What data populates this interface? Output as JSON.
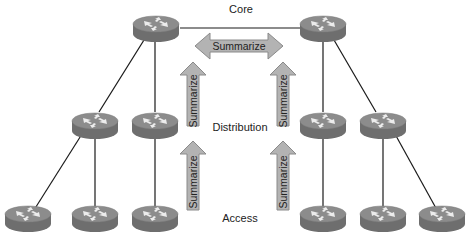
{
  "layers": {
    "core": "Core",
    "distribution": "Distribution",
    "access": "Access"
  },
  "arrows": {
    "core_horizontal": "Summarize",
    "left_upper": "Summarize",
    "right_upper": "Summarize",
    "left_lower": "Summarize",
    "right_lower": "Summarize"
  },
  "colors": {
    "router_top": "#8c8c8c",
    "router_side": "#6e6e6e",
    "arrow_fill": "#b3b3b3",
    "arrow_stroke": "#8a8a8a",
    "link": "#1a1a1a"
  },
  "routers": [
    {
      "id": "core-left",
      "layer": "core",
      "cx": 156,
      "cy": 28
    },
    {
      "id": "core-right",
      "layer": "core",
      "cx": 323,
      "cy": 28
    },
    {
      "id": "dist-left-1",
      "layer": "distribution",
      "cx": 95,
      "cy": 125
    },
    {
      "id": "dist-left-2",
      "layer": "distribution",
      "cx": 155,
      "cy": 125
    },
    {
      "id": "dist-right-1",
      "layer": "distribution",
      "cx": 323,
      "cy": 125
    },
    {
      "id": "dist-right-2",
      "layer": "distribution",
      "cx": 383,
      "cy": 125
    },
    {
      "id": "access-left-1",
      "layer": "access",
      "cx": 28,
      "cy": 218
    },
    {
      "id": "access-left-2",
      "layer": "access",
      "cx": 95,
      "cy": 218
    },
    {
      "id": "access-left-3",
      "layer": "access",
      "cx": 155,
      "cy": 218
    },
    {
      "id": "access-right-1",
      "layer": "access",
      "cx": 323,
      "cy": 218
    },
    {
      "id": "access-right-2",
      "layer": "access",
      "cx": 383,
      "cy": 218
    },
    {
      "id": "access-right-3",
      "layer": "access",
      "cx": 442,
      "cy": 218
    }
  ]
}
